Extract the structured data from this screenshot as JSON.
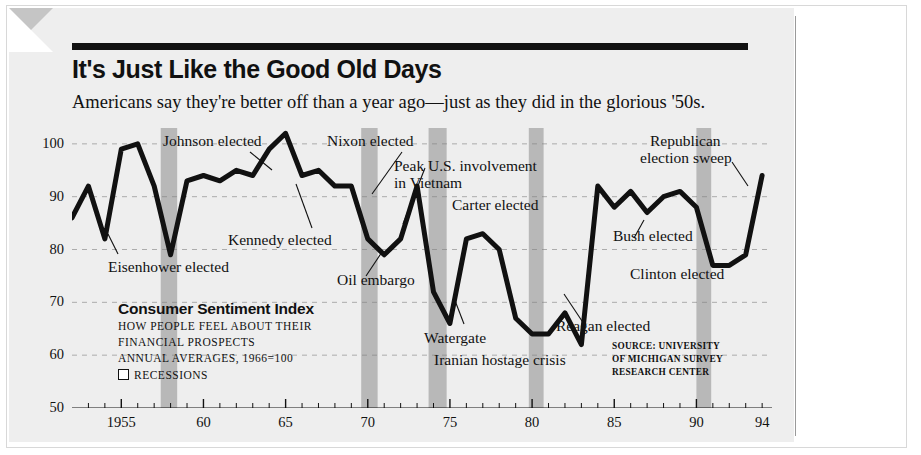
{
  "headline": "It's Just Like the Good Old Days",
  "subhead": "Americans say they're better off than a year ago—just as they did in the glorious '50s.",
  "legend": {
    "title": "Consumer Sentiment Index",
    "line1": "HOW PEOPLE FEEL ABOUT THEIR",
    "line2": "FINANCIAL PROSPECTS",
    "line3": "ANNUAL AVERAGES, 1966=100",
    "recessions": "RECESSIONS"
  },
  "source": {
    "line1": "SOURCE: UNIVERSITY",
    "line2": "OF MICHIGAN SURVEY",
    "line3": "RESEARCH CENTER"
  },
  "annotations": [
    {
      "id": "eisenhower",
      "text": "Eisenhower elected"
    },
    {
      "id": "johnson",
      "text": "Johnson elected"
    },
    {
      "id": "kennedy",
      "text": "Kennedy elected"
    },
    {
      "id": "nixon",
      "text": "Nixon elected"
    },
    {
      "id": "vietnam-1",
      "text": "Peak U.S. involvement"
    },
    {
      "id": "vietnam-2",
      "text": "in Vietnam"
    },
    {
      "id": "oil-embargo",
      "text": "Oil embargo"
    },
    {
      "id": "watergate",
      "text": "Watergate"
    },
    {
      "id": "iranian",
      "text": "Iranian hostage crisis"
    },
    {
      "id": "carter",
      "text": "Carter elected"
    },
    {
      "id": "reagan",
      "text": "Reagan elected"
    },
    {
      "id": "bush",
      "text": "Bush elected"
    },
    {
      "id": "clinton",
      "text": "Clinton elected"
    },
    {
      "id": "republican-1",
      "text": "Republican"
    },
    {
      "id": "republican-2",
      "text": "election sweep"
    }
  ],
  "chart_data": {
    "type": "line",
    "title": "Consumer Sentiment Index",
    "xlabel": "",
    "ylabel": "",
    "ylim": [
      50,
      103
    ],
    "xlim": [
      1952,
      1994.6
    ],
    "grid": true,
    "legend_position": "lower-left",
    "ytick_labels": [
      "100",
      "90",
      "80",
      "70",
      "60",
      "50"
    ],
    "ytick_values": [
      100,
      90,
      80,
      70,
      60,
      50
    ],
    "xtick_labels": [
      "1955",
      "60",
      "65",
      "70",
      "75",
      "80",
      "85",
      "90",
      "94"
    ],
    "xtick_values": [
      1955,
      1960,
      1965,
      1970,
      1975,
      1980,
      1985,
      1990,
      1994
    ],
    "x": [
      1952,
      1953,
      1954,
      1955,
      1956,
      1957,
      1958,
      1959,
      1960,
      1961,
      1962,
      1963,
      1964,
      1965,
      1966,
      1967,
      1968,
      1969,
      1970,
      1971,
      1972,
      1973,
      1974,
      1975,
      1976,
      1977,
      1978,
      1979,
      1980,
      1981,
      1982,
      1983,
      1984,
      1985,
      1986,
      1987,
      1988,
      1989,
      1990,
      1991,
      1992,
      1993,
      1994
    ],
    "values": [
      86,
      92,
      82,
      99,
      100,
      92,
      79,
      93,
      94,
      93,
      95,
      94,
      99,
      102,
      94,
      95,
      92,
      92,
      82,
      79,
      82,
      92,
      72,
      66,
      82,
      83,
      80,
      67,
      64,
      64,
      68,
      62,
      92,
      88,
      91,
      87,
      90,
      91,
      88,
      77,
      77,
      79,
      94
    ],
    "series_color": "#111111",
    "series_width": 5,
    "recession_bands": [
      {
        "start": 1957.4,
        "end": 1958.4
      },
      {
        "start": 1969.6,
        "end": 1970.6
      },
      {
        "start": 1973.7,
        "end": 1974.8
      },
      {
        "start": 1979.8,
        "end": 1980.7
      },
      {
        "start": 1990.0,
        "end": 1990.9
      }
    ],
    "recession_color": "#b8b8b8"
  }
}
